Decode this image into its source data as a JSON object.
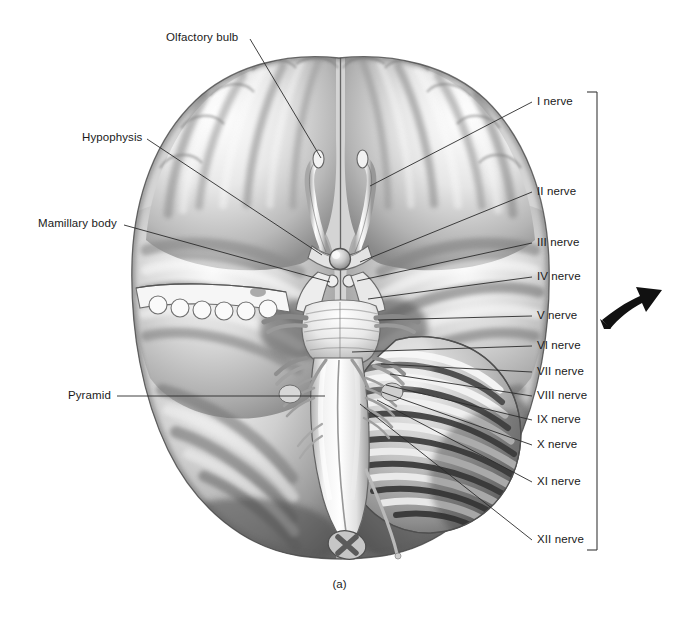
{
  "figure": {
    "caption": "(a)",
    "background_color": "#ffffff",
    "ink_color": "#1a1a1a",
    "leader_line_color": "#2b2b2b",
    "arrow_color": "#111111"
  },
  "left_labels": [
    {
      "id": "olfactory-bulb",
      "text": "Olfactory bulb",
      "x": 166,
      "y": 32,
      "anchor_x": 250,
      "anchor_y": 39,
      "target_x": 321,
      "target_y": 158
    },
    {
      "id": "hypophysis",
      "text": "Hypophysis",
      "x": 82,
      "y": 132,
      "anchor_x": 147,
      "anchor_y": 139,
      "target_x": 322,
      "target_y": 255
    },
    {
      "id": "mamillary-body",
      "text": "Mamillary body",
      "x": 38,
      "y": 218,
      "anchor_x": 124,
      "anchor_y": 225,
      "target_x": 330,
      "target_y": 282
    },
    {
      "id": "pyramid",
      "text": "Pyramid",
      "x": 68,
      "y": 390,
      "anchor_x": 117,
      "anchor_y": 396,
      "target_x": 325,
      "target_y": 396
    }
  ],
  "nerve_labels": [
    {
      "id": "nerve-i",
      "text": "I nerve",
      "x": 537,
      "y": 96,
      "anchor_x": 532,
      "anchor_y": 102,
      "target_x": 370,
      "target_y": 186
    },
    {
      "id": "nerve-ii",
      "text": "II nerve",
      "x": 537,
      "y": 186,
      "anchor_x": 532,
      "anchor_y": 192,
      "target_x": 360,
      "target_y": 262
    },
    {
      "id": "nerve-iii",
      "text": "III nerve",
      "x": 537,
      "y": 237,
      "anchor_x": 532,
      "anchor_y": 243,
      "target_x": 357,
      "target_y": 281
    },
    {
      "id": "nerve-iv",
      "text": "IV nerve",
      "x": 537,
      "y": 271,
      "anchor_x": 532,
      "anchor_y": 277,
      "target_x": 368,
      "target_y": 299
    },
    {
      "id": "nerve-v",
      "text": "V nerve",
      "x": 537,
      "y": 310,
      "anchor_x": 532,
      "anchor_y": 316,
      "target_x": 378,
      "target_y": 320
    },
    {
      "id": "nerve-vi",
      "text": "VI nerve",
      "x": 537,
      "y": 340,
      "anchor_x": 532,
      "anchor_y": 346,
      "target_x": 352,
      "target_y": 352
    },
    {
      "id": "nerve-vii",
      "text": "VII nerve",
      "x": 537,
      "y": 366,
      "anchor_x": 532,
      "anchor_y": 372,
      "target_x": 381,
      "target_y": 364
    },
    {
      "id": "nerve-viii",
      "text": "VIII nerve",
      "x": 537,
      "y": 390,
      "anchor_x": 532,
      "anchor_y": 396,
      "target_x": 390,
      "target_y": 374
    },
    {
      "id": "nerve-ix",
      "text": "IX nerve",
      "x": 537,
      "y": 414,
      "anchor_x": 532,
      "anchor_y": 420,
      "target_x": 386,
      "target_y": 385
    },
    {
      "id": "nerve-x",
      "text": "X nerve",
      "x": 537,
      "y": 439,
      "anchor_x": 532,
      "anchor_y": 445,
      "target_x": 382,
      "target_y": 392
    },
    {
      "id": "nerve-xi",
      "text": "XI nerve",
      "x": 537,
      "y": 476,
      "anchor_x": 532,
      "anchor_y": 482,
      "target_x": 377,
      "target_y": 400
    },
    {
      "id": "nerve-xii",
      "text": "XII nerve",
      "x": 537,
      "y": 534,
      "anchor_x": 532,
      "anchor_y": 540,
      "target_x": 360,
      "target_y": 404
    }
  ],
  "bracket": {
    "id": "cranial-nerve-bracket",
    "x": 597,
    "top_y": 92,
    "bottom_y": 550,
    "tick_length": 10
  },
  "arrow": {
    "id": "direction-arrow",
    "x": 600,
    "y": 285,
    "width": 68,
    "height": 50,
    "direction": "up-right"
  }
}
